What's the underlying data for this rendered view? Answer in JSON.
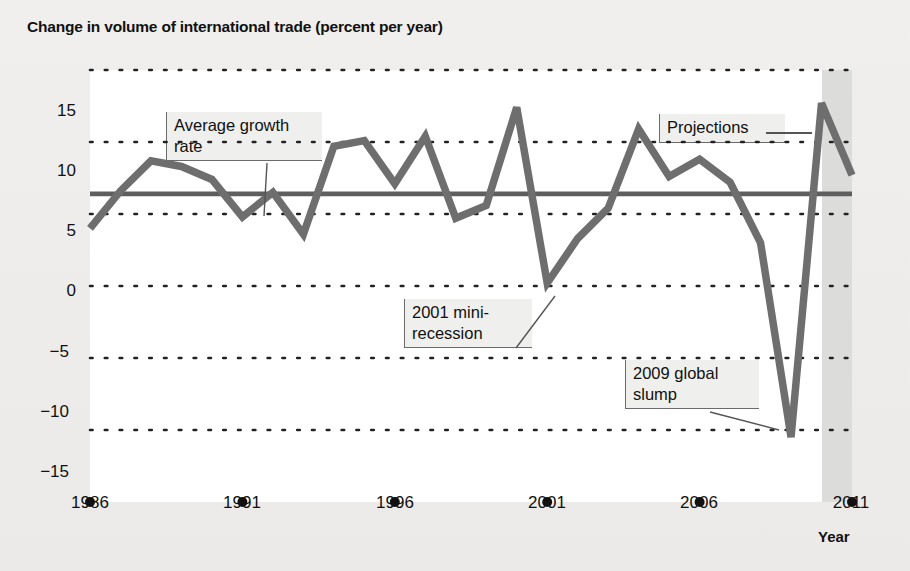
{
  "figure": {
    "title": "Change in volume of international trade (percent per year)",
    "x_axis_title": "Year",
    "background_color": "#efeeec",
    "plot_background_color": "#ffffff",
    "series_color": "#6e6e6e",
    "average_line_color": "#5e5e5e",
    "grid_color": "#222222",
    "projection_band_color": "#dcdcda"
  },
  "annotations": [
    {
      "name": "average-growth-rate",
      "text": "Average growth\nrate"
    },
    {
      "name": "projections",
      "text": "Projections"
    },
    {
      "name": "mini-recession-2001",
      "text": "2001 mini-\nrecession"
    },
    {
      "name": "global-slump-2009",
      "text": "2009 global\nslump"
    }
  ],
  "chart_data": {
    "type": "line",
    "title": "Change in volume of international trade (percent per year)",
    "xlabel": "Year",
    "ylabel": "",
    "xlim": [
      1986,
      2011
    ],
    "ylim": [
      -15,
      15
    ],
    "yticks": [
      15,
      10,
      5,
      0,
      -5,
      -10,
      -15
    ],
    "xticks": [
      1986,
      1991,
      1996,
      2001,
      2006,
      2011
    ],
    "grid": "horizontal-dotted",
    "legend": "none",
    "x": [
      1986,
      1987,
      1988,
      1989,
      1990,
      1991,
      1992,
      1993,
      1994,
      1995,
      1996,
      1997,
      1998,
      1999,
      2000,
      2001,
      2002,
      2003,
      2004,
      2005,
      2006,
      2007,
      2008,
      2009,
      2010,
      2011
    ],
    "series": [
      {
        "name": "Change in volume of international trade",
        "values": [
          4.0,
          6.6,
          8.7,
          8.3,
          7.4,
          4.8,
          6.5,
          3.6,
          9.7,
          10.1,
          7.1,
          10.4,
          4.7,
          5.6,
          12.4,
          0.2,
          3.3,
          5.4,
          10.9,
          7.6,
          8.8,
          7.2,
          3.0,
          -10.5,
          12.7,
          7.7
        ]
      }
    ],
    "average_line": {
      "label": "Average growth rate",
      "value": 6.4
    },
    "projection_region": {
      "start": 2010,
      "end": 2011,
      "label": "Projections"
    },
    "annotated_points": [
      {
        "label": "2001 mini-recession",
        "x": 2001,
        "y": 0.2
      },
      {
        "label": "2009 global slump",
        "x": 2009,
        "y": -10.5
      }
    ]
  },
  "axis": {
    "y_tick_labels": [
      "15",
      "10",
      "5",
      "0",
      "−5",
      "−10",
      "−15"
    ],
    "x_tick_labels": [
      "1986",
      "1991",
      "1996",
      "2001",
      "2006",
      "2011"
    ]
  }
}
